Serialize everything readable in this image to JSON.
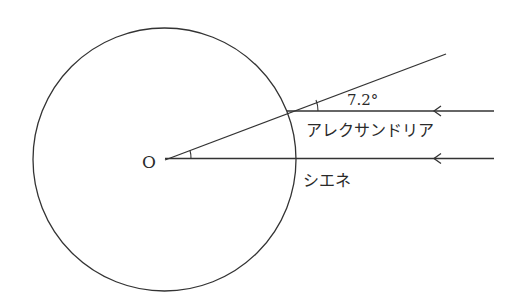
{
  "diagram": {
    "center_label": "O",
    "angle_label": "7.2°",
    "location_alexandria": "アレクサンドリア",
    "location_syene": "シエネ"
  },
  "colors": {
    "stroke": "#333333",
    "background": "#ffffff"
  }
}
